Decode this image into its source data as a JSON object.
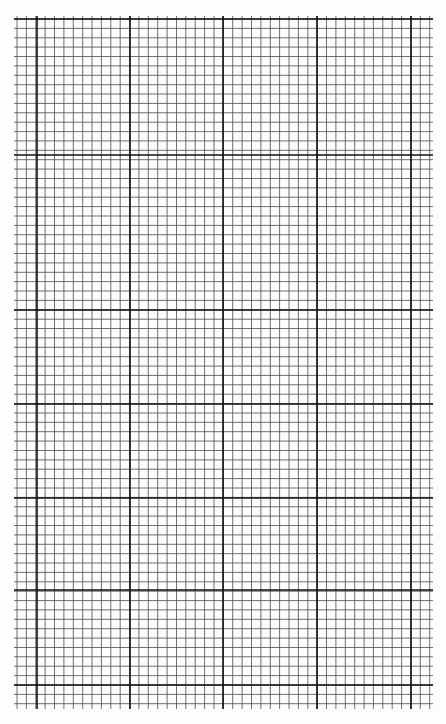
{
  "sheet": {
    "type": "graph-paper",
    "header_text": "",
    "background": "#fdfdfd",
    "line_color": "#2a2a2a",
    "grid": {
      "left": 17,
      "top": 19,
      "right": 430,
      "bottom": 706,
      "cell_size": 9.38,
      "minor_color": "#4a4a4a",
      "minor_width": 0.8,
      "major_color": "#111111",
      "major_width": 1.6,
      "major_x": [
        37,
        130,
        223,
        317,
        411
      ],
      "major_y": [
        155,
        310,
        404,
        498,
        590,
        685
      ]
    }
  }
}
